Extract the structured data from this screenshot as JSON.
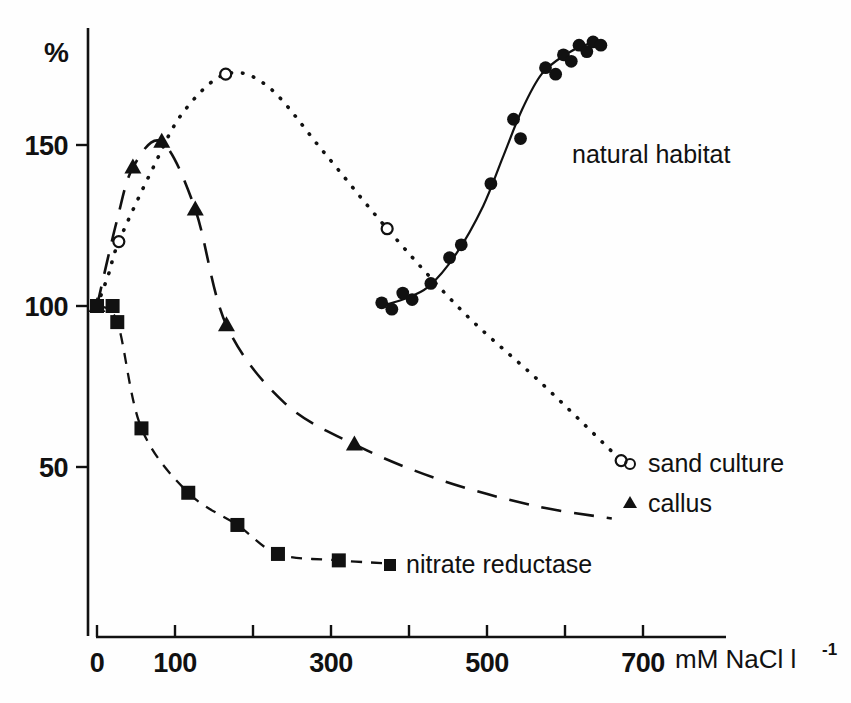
{
  "figure": {
    "background_color": "#fefefe",
    "ink_color": "#111111"
  },
  "axes": {
    "y_unit_label": "%",
    "y_ticks": [
      "50",
      "100",
      "150"
    ],
    "x_ticks": [
      "0",
      "100",
      "300",
      "500",
      "700"
    ],
    "x_axis_unit": "mM NaCl l",
    "x_axis_unit_exponent": "-1"
  },
  "series_labels": {
    "natural_habitat": "natural habitat",
    "sand_culture": "sand culture",
    "callus": "callus",
    "nitrate_reductase": "nitrate reductase"
  },
  "chart_data": {
    "type": "scatter",
    "title": "",
    "xlabel": "mM NaCl l-1",
    "ylabel": "%",
    "xlim": [
      0,
      700
    ],
    "ylim": [
      0,
      190
    ],
    "x_ticks": [
      0,
      100,
      200,
      300,
      400,
      500,
      600,
      700
    ],
    "x_tick_labels": [
      "0",
      "100",
      "",
      "300",
      "",
      "500",
      "",
      "700"
    ],
    "y_ticks": [
      50,
      100,
      150
    ],
    "grid": false,
    "legend_position": "inline-right",
    "series": [
      {
        "name": "sand culture",
        "marker": "open-circle",
        "line": "dotted",
        "points": [
          {
            "x": 0,
            "y": 100
          },
          {
            "x": 28,
            "y": 120
          },
          {
            "x": 165,
            "y": 172
          },
          {
            "x": 372,
            "y": 124
          },
          {
            "x": 672,
            "y": 52
          }
        ],
        "curve": [
          {
            "x": 0,
            "y": 100
          },
          {
            "x": 15,
            "y": 110
          },
          {
            "x": 28,
            "y": 120
          },
          {
            "x": 70,
            "y": 142
          },
          {
            "x": 110,
            "y": 160
          },
          {
            "x": 165,
            "y": 172
          },
          {
            "x": 220,
            "y": 168
          },
          {
            "x": 290,
            "y": 148
          },
          {
            "x": 372,
            "y": 124
          },
          {
            "x": 470,
            "y": 98
          },
          {
            "x": 570,
            "y": 76
          },
          {
            "x": 672,
            "y": 52
          }
        ]
      },
      {
        "name": "callus",
        "marker": "filled-triangle",
        "line": "dashed-long",
        "points": [
          {
            "x": 0,
            "y": 100
          },
          {
            "x": 46,
            "y": 143
          },
          {
            "x": 83,
            "y": 151
          },
          {
            "x": 126,
            "y": 130
          },
          {
            "x": 166,
            "y": 94
          },
          {
            "x": 330,
            "y": 57
          }
        ],
        "curve": [
          {
            "x": 0,
            "y": 100
          },
          {
            "x": 25,
            "y": 126
          },
          {
            "x": 46,
            "y": 143
          },
          {
            "x": 83,
            "y": 151
          },
          {
            "x": 126,
            "y": 130
          },
          {
            "x": 166,
            "y": 94
          },
          {
            "x": 240,
            "y": 70
          },
          {
            "x": 330,
            "y": 57
          },
          {
            "x": 440,
            "y": 46
          },
          {
            "x": 560,
            "y": 38
          },
          {
            "x": 660,
            "y": 34
          }
        ]
      },
      {
        "name": "nitrate reductase",
        "marker": "filled-square",
        "line": "dashed-short",
        "points": [
          {
            "x": 0,
            "y": 100
          },
          {
            "x": 20,
            "y": 100
          },
          {
            "x": 26,
            "y": 95
          },
          {
            "x": 57,
            "y": 62
          },
          {
            "x": 117,
            "y": 42
          },
          {
            "x": 180,
            "y": 32
          },
          {
            "x": 232,
            "y": 23
          },
          {
            "x": 310,
            "y": 21
          }
        ],
        "curve": [
          {
            "x": 0,
            "y": 100
          },
          {
            "x": 26,
            "y": 95
          },
          {
            "x": 57,
            "y": 62
          },
          {
            "x": 117,
            "y": 42
          },
          {
            "x": 180,
            "y": 32
          },
          {
            "x": 232,
            "y": 23
          },
          {
            "x": 310,
            "y": 21
          },
          {
            "x": 378,
            "y": 20
          }
        ]
      },
      {
        "name": "natural habitat",
        "marker": "filled-circle",
        "line": "solid",
        "points": [
          {
            "x": 365,
            "y": 101
          },
          {
            "x": 378,
            "y": 99
          },
          {
            "x": 392,
            "y": 104
          },
          {
            "x": 404,
            "y": 102
          },
          {
            "x": 428,
            "y": 107
          },
          {
            "x": 452,
            "y": 115
          },
          {
            "x": 467,
            "y": 119
          },
          {
            "x": 505,
            "y": 138
          },
          {
            "x": 534,
            "y": 158
          },
          {
            "x": 543,
            "y": 152
          },
          {
            "x": 575,
            "y": 174
          },
          {
            "x": 588,
            "y": 172
          },
          {
            "x": 598,
            "y": 178
          },
          {
            "x": 608,
            "y": 176
          },
          {
            "x": 618,
            "y": 181
          },
          {
            "x": 628,
            "y": 179
          },
          {
            "x": 636,
            "y": 182
          },
          {
            "x": 646,
            "y": 181
          }
        ],
        "curve": [
          {
            "x": 362,
            "y": 100
          },
          {
            "x": 392,
            "y": 102
          },
          {
            "x": 425,
            "y": 106
          },
          {
            "x": 460,
            "y": 116
          },
          {
            "x": 495,
            "y": 131
          },
          {
            "x": 520,
            "y": 146
          },
          {
            "x": 545,
            "y": 161
          },
          {
            "x": 570,
            "y": 172
          },
          {
            "x": 600,
            "y": 178
          },
          {
            "x": 625,
            "y": 181
          },
          {
            "x": 648,
            "y": 182
          }
        ]
      }
    ]
  }
}
